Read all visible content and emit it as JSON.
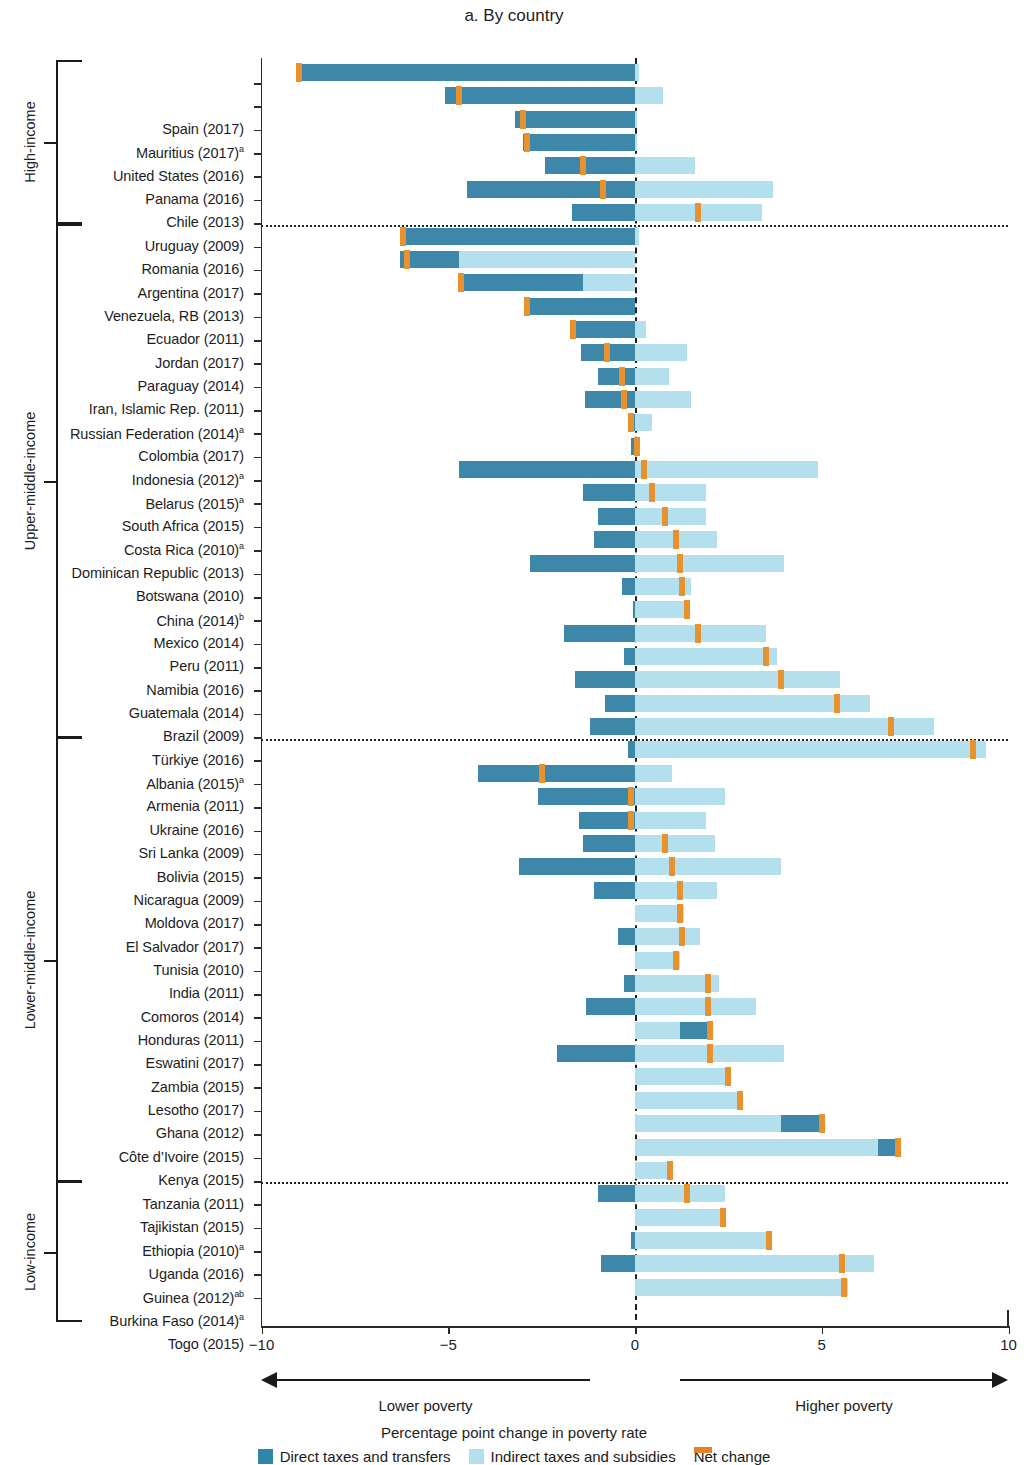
{
  "title": "a. By country",
  "axis": {
    "x_title": "Percentage point change in poverty rate",
    "ticks": [
      "−10",
      "−5",
      "0",
      "5",
      "10"
    ],
    "tick_values": [
      -10,
      -5,
      0,
      5,
      10
    ],
    "left_caption": "Lower poverty",
    "right_caption": "Higher poverty"
  },
  "legend": {
    "direct": "Direct taxes and transfers",
    "indirect": "Indirect taxes and subsidies",
    "net": "Net change"
  },
  "colors": {
    "direct": "#3d88a8",
    "indirect": "#b3e0ec",
    "net": "#e8922f"
  },
  "groups": [
    {
      "name": "High-income",
      "count": 7
    },
    {
      "name": "Upper-middle-income",
      "count": 22
    },
    {
      "name": "Lower-middle-income",
      "count": 19
    },
    {
      "name": "Low-income",
      "count": 6
    }
  ],
  "chart_data": {
    "type": "bar",
    "title": "a. By country",
    "xlabel": "Percentage point change in poverty rate",
    "ylabel": "",
    "xlim": [
      -10,
      10
    ],
    "grid": false,
    "legend_position": "bottom",
    "series": [
      {
        "name": "Direct taxes and transfers",
        "color": "#3d88a8"
      },
      {
        "name": "Indirect taxes and subsidies",
        "color": "#b3e0ec"
      },
      {
        "name": "Net change",
        "color": "#e8922f"
      }
    ],
    "note": "Each row is a floating stacked bar: the direct segment and the indirect segment are laid end to end; the orange tick marks the net change (sum).",
    "rows": [
      {
        "label": "Spain (2017)",
        "group": "High-income",
        "direct": -9.0,
        "indirect": 0.0,
        "net": -9.0,
        "direct_start": -9.05,
        "direct_end": 0.0,
        "indirect_start": 0.0,
        "indirect_end": 0.1
      },
      {
        "label": "Mauritius (2017)",
        "sup": "a",
        "group": "High-income",
        "direct": -5.1,
        "indirect": 0.75,
        "net": -4.7,
        "direct_start": -5.1,
        "direct_end": 0.0,
        "indirect_start": 0.0,
        "indirect_end": 0.75
      },
      {
        "label": "United States (2016)",
        "group": "High-income",
        "direct": -3.2,
        "indirect": 0.05,
        "net": -3.0,
        "direct_start": -3.2,
        "direct_end": 0.0,
        "indirect_start": 0.0,
        "indirect_end": 0.05
      },
      {
        "label": "Panama (2016)",
        "group": "High-income",
        "direct": -3.0,
        "indirect": 0.05,
        "net": -2.9,
        "direct_start": -3.0,
        "direct_end": 0.0,
        "indirect_start": 0.0,
        "indirect_end": 0.05
      },
      {
        "label": "Chile (2013)",
        "group": "High-income",
        "direct": -2.4,
        "indirect": 1.6,
        "net": -1.4,
        "direct_start": -2.4,
        "direct_end": 0.0,
        "indirect_start": 0.0,
        "indirect_end": 1.6
      },
      {
        "label": "Uruguay (2009)",
        "group": "High-income",
        "direct": -4.5,
        "indirect": 3.7,
        "net": -0.85,
        "direct_start": -4.5,
        "direct_end": 0.0,
        "indirect_start": 0.0,
        "indirect_end": 3.7
      },
      {
        "label": "Romania (2016)",
        "group": "High-income",
        "direct": -1.7,
        "indirect": 3.4,
        "net": 1.7,
        "direct_start": -1.7,
        "direct_end": 0.0,
        "indirect_start": 0.0,
        "indirect_end": 3.4
      },
      {
        "label": "Argentina (2017)",
        "group": "Upper-middle-income",
        "direct": -6.3,
        "indirect": 0.1,
        "net": -6.2,
        "direct_start": -6.3,
        "direct_end": 0.0,
        "indirect_start": 0.0,
        "indirect_end": 0.1
      },
      {
        "label": "Venezuela, RB (2013)",
        "group": "Upper-middle-income",
        "direct": -1.6,
        "indirect": 4.7,
        "net": -6.1,
        "direct_start": -6.3,
        "direct_end": -4.7,
        "indirect_start": -4.7,
        "indirect_end": 0.0
      },
      {
        "label": "Ecuador (2011)",
        "group": "Upper-middle-income",
        "direct": -3.3,
        "indirect": 1.5,
        "net": -4.65,
        "direct_start": -4.65,
        "direct_end": -1.4,
        "indirect_start": -1.4,
        "indirect_end": 0.0
      },
      {
        "label": "Jordan (2017)",
        "group": "Upper-middle-income",
        "direct": -2.9,
        "indirect": 0.0,
        "net": -2.9,
        "direct_start": -2.9,
        "direct_end": 0.0,
        "indirect_start": 0.0,
        "indirect_end": 0.0
      },
      {
        "label": "Paraguay (2014)",
        "group": "Upper-middle-income",
        "direct": -1.65,
        "indirect": 0.3,
        "net": -1.65,
        "direct_start": -1.65,
        "direct_end": 0.0,
        "indirect_start": 0.0,
        "indirect_end": 0.3
      },
      {
        "label": "Iran, Islamic Rep. (2011)",
        "group": "Upper-middle-income",
        "direct": -1.45,
        "indirect": 1.4,
        "net": -0.75,
        "direct_start": -1.45,
        "direct_end": 0.0,
        "indirect_start": 0.0,
        "indirect_end": 1.4
      },
      {
        "label": "Russian Federation (2014)",
        "sup": "a",
        "group": "Upper-middle-income",
        "direct": -1.0,
        "indirect": 0.9,
        "net": -0.35,
        "direct_start": -1.0,
        "direct_end": 0.0,
        "indirect_start": 0.0,
        "indirect_end": 0.9
      },
      {
        "label": "Colombia (2017)",
        "group": "Upper-middle-income",
        "direct": -1.35,
        "indirect": 1.5,
        "net": -0.3,
        "direct_start": -1.35,
        "direct_end": 0.0,
        "indirect_start": 0.0,
        "indirect_end": 1.5
      },
      {
        "label": "Indonesia (2012)",
        "sup": "a",
        "group": "Upper-middle-income",
        "direct": -0.2,
        "indirect": 0.35,
        "net": -0.1,
        "direct_start": -0.2,
        "direct_end": 0.0,
        "indirect_start": 0.0,
        "indirect_end": 0.45
      },
      {
        "label": "Belarus (2015)",
        "sup": "a",
        "group": "Upper-middle-income",
        "direct": -0.1,
        "indirect": 0.15,
        "net": 0.05,
        "direct_start": -0.1,
        "direct_end": 0.0,
        "indirect_start": 0.0,
        "indirect_end": 0.1
      },
      {
        "label": "South Africa (2015)",
        "group": "Upper-middle-income",
        "direct": -4.7,
        "indirect": 4.9,
        "net": 0.25,
        "direct_start": -4.7,
        "direct_end": 0.0,
        "indirect_start": 0.0,
        "indirect_end": 4.9
      },
      {
        "label": "Costa Rica (2010)",
        "sup": "a",
        "group": "Upper-middle-income",
        "direct": -1.4,
        "indirect": 1.9,
        "net": 0.45,
        "direct_start": -1.4,
        "direct_end": 0.0,
        "indirect_start": 0.0,
        "indirect_end": 1.9
      },
      {
        "label": "Dominican Republic (2013)",
        "group": "Upper-middle-income",
        "direct": -1.0,
        "indirect": 1.9,
        "net": 0.8,
        "direct_start": -1.0,
        "direct_end": 0.0,
        "indirect_start": 0.0,
        "indirect_end": 1.9
      },
      {
        "label": "Botswana (2010)",
        "group": "Upper-middle-income",
        "direct": -1.1,
        "indirect": 2.2,
        "net": 1.1,
        "direct_start": -1.1,
        "direct_end": 0.0,
        "indirect_start": 0.0,
        "indirect_end": 2.2
      },
      {
        "label": "China (2014)",
        "sup": "b",
        "group": "Upper-middle-income",
        "direct": -2.8,
        "indirect": 4.0,
        "net": 1.2,
        "direct_start": -2.8,
        "direct_end": 0.0,
        "indirect_start": 0.0,
        "indirect_end": 4.0
      },
      {
        "label": "Mexico (2014)",
        "group": "Upper-middle-income",
        "direct": -0.35,
        "indirect": 1.5,
        "net": 1.25,
        "direct_start": -0.35,
        "direct_end": 0.0,
        "indirect_start": 0.0,
        "indirect_end": 1.5
      },
      {
        "label": "Peru (2011)",
        "group": "Upper-middle-income",
        "direct": -0.05,
        "indirect": 1.45,
        "net": 1.4,
        "direct_start": -0.05,
        "direct_end": 0.0,
        "indirect_start": 0.0,
        "indirect_end": 1.45
      },
      {
        "label": "Namibia (2016)",
        "group": "Upper-middle-income",
        "direct": -1.9,
        "indirect": 3.5,
        "net": 1.7,
        "direct_start": -1.9,
        "direct_end": 0.0,
        "indirect_start": 0.0,
        "indirect_end": 3.5
      },
      {
        "label": "Guatemala (2014)",
        "group": "Upper-middle-income",
        "direct": -0.3,
        "indirect": 3.8,
        "net": 3.5,
        "direct_start": -0.3,
        "direct_end": 0.0,
        "indirect_start": 0.0,
        "indirect_end": 3.8
      },
      {
        "label": "Brazil (2009)",
        "group": "Upper-middle-income",
        "direct": -1.6,
        "indirect": 5.5,
        "net": 3.9,
        "direct_start": -1.6,
        "direct_end": 0.0,
        "indirect_start": 0.0,
        "indirect_end": 5.5
      },
      {
        "label": "Türkiye (2016)",
        "group": "Upper-middle-income",
        "direct": -0.8,
        "indirect": 6.3,
        "net": 5.4,
        "direct_start": -0.8,
        "direct_end": 0.0,
        "indirect_start": 0.0,
        "indirect_end": 6.3
      },
      {
        "label": "Albania (2015)",
        "sup": "a",
        "group": "Upper-middle-income",
        "direct": -1.2,
        "indirect": 8.0,
        "net": 6.85,
        "direct_start": -1.2,
        "direct_end": 0.0,
        "indirect_start": 0.0,
        "indirect_end": 8.0
      },
      {
        "label": "Armenia (2011)",
        "group": "Upper-middle-income",
        "direct": -0.2,
        "indirect": 9.4,
        "net": 9.05,
        "direct_start": -0.2,
        "direct_end": 0.0,
        "indirect_start": 0.0,
        "indirect_end": 9.4
      },
      {
        "label": "Ukraine (2016)",
        "group": "Lower-middle-income",
        "direct": -4.2,
        "indirect": 1.0,
        "net": -2.5,
        "direct_start": -4.2,
        "direct_end": 0.0,
        "indirect_start": 0.0,
        "indirect_end": 1.0
      },
      {
        "label": "Sri Lanka (2009)",
        "group": "Lower-middle-income",
        "direct": -2.6,
        "indirect": 2.4,
        "net": -0.1,
        "direct_start": -2.6,
        "direct_end": 0.0,
        "indirect_start": 0.0,
        "indirect_end": 2.4
      },
      {
        "label": "Bolivia (2015)",
        "group": "Lower-middle-income",
        "direct": -1.5,
        "indirect": 1.9,
        "net": -0.1,
        "direct_start": -1.5,
        "direct_end": 0.0,
        "indirect_start": 0.0,
        "indirect_end": 1.9
      },
      {
        "label": "Nicaragua (2009)",
        "group": "Lower-middle-income",
        "direct": -1.4,
        "indirect": 2.15,
        "net": 0.8,
        "direct_start": -1.4,
        "direct_end": 0.0,
        "indirect_start": 0.0,
        "indirect_end": 2.15
      },
      {
        "label": "Moldova (2017)",
        "group": "Lower-middle-income",
        "direct": -3.1,
        "indirect": 3.9,
        "net": 1.0,
        "direct_start": -3.1,
        "direct_end": 0.0,
        "indirect_start": 0.0,
        "indirect_end": 3.9
      },
      {
        "label": "El Salvador (2017)",
        "group": "Lower-middle-income",
        "direct": -1.1,
        "indirect": 2.2,
        "net": 1.2,
        "direct_start": -1.1,
        "direct_end": 0.0,
        "indirect_start": 0.0,
        "indirect_end": 2.2
      },
      {
        "label": "Tunisia (2010)",
        "group": "Lower-middle-income",
        "direct": 0.0,
        "indirect": 1.3,
        "net": 1.2,
        "direct_start": 0.0,
        "direct_end": 0.0,
        "indirect_start": 0.0,
        "indirect_end": 1.3
      },
      {
        "label": "India (2011)",
        "group": "Lower-middle-income",
        "direct": -0.45,
        "indirect": 1.75,
        "net": 1.25,
        "direct_start": -0.45,
        "direct_end": 0.0,
        "indirect_start": 0.0,
        "indirect_end": 1.75
      },
      {
        "label": "Comoros (2014)",
        "group": "Lower-middle-income",
        "direct": 0.0,
        "indirect": 1.2,
        "net": 1.1,
        "direct_start": 0.0,
        "direct_end": 0.0,
        "indirect_start": 0.0,
        "indirect_end": 1.2
      },
      {
        "label": "Honduras (2011)",
        "group": "Lower-middle-income",
        "direct": -0.3,
        "indirect": 2.25,
        "net": 1.95,
        "direct_start": -0.3,
        "direct_end": 0.0,
        "indirect_start": 0.0,
        "indirect_end": 2.25
      },
      {
        "label": "Eswatini (2017)",
        "group": "Lower-middle-income",
        "direct": -1.3,
        "indirect": 3.25,
        "net": 1.95,
        "direct_start": -1.3,
        "direct_end": 0.0,
        "indirect_start": 0.0,
        "indirect_end": 3.25
      },
      {
        "label": "Zambia (2015)",
        "group": "Lower-middle-income",
        "direct": 0.8,
        "indirect": 1.2,
        "net": 2.0,
        "direct_start": 1.2,
        "direct_end": 2.0,
        "indirect_start": 0.0,
        "indirect_end": 1.2
      },
      {
        "label": "Lesotho (2017)",
        "group": "Lower-middle-income",
        "direct": -2.1,
        "indirect": 4.0,
        "net": 2.0,
        "direct_start": -2.1,
        "direct_end": 0.0,
        "indirect_start": 0.0,
        "indirect_end": 4.0
      },
      {
        "label": "Ghana (2012)",
        "group": "Lower-middle-income",
        "direct": 0.0,
        "indirect": 2.5,
        "net": 2.5,
        "direct_start": 0.0,
        "direct_end": 0.0,
        "indirect_start": 0.0,
        "indirect_end": 2.5
      },
      {
        "label": "Côte d’Ivoire (2015)",
        "group": "Lower-middle-income",
        "direct": 0.0,
        "indirect": 2.85,
        "net": 2.8,
        "direct_start": 0.0,
        "direct_end": 0.0,
        "indirect_start": 0.0,
        "indirect_end": 2.85
      },
      {
        "label": "Kenya (2015)",
        "group": "Lower-middle-income",
        "direct": 1.1,
        "indirect": 3.9,
        "net": 5.0,
        "direct_start": 3.9,
        "direct_end": 5.05,
        "indirect_start": 0.0,
        "indirect_end": 3.9
      },
      {
        "label": "Tanzania (2011)",
        "group": "Lower-middle-income",
        "direct": 0.6,
        "indirect": 6.5,
        "net": 7.05,
        "direct_start": 6.5,
        "direct_end": 7.1,
        "indirect_start": 0.0,
        "indirect_end": 6.5
      },
      {
        "label": "Tajikistan (2015)",
        "group": "Low-income",
        "direct": 0.0,
        "indirect": 1.0,
        "net": 0.95,
        "direct_start": 0.0,
        "direct_end": 0.0,
        "indirect_start": 0.0,
        "indirect_end": 1.0
      },
      {
        "label": "Ethiopia (2010)",
        "sup": "a",
        "group": "Low-income",
        "direct": -1.0,
        "indirect": 2.4,
        "net": 1.4,
        "direct_start": -1.0,
        "direct_end": 0.0,
        "indirect_start": 0.0,
        "indirect_end": 2.4
      },
      {
        "label": "Uganda (2016)",
        "group": "Low-income",
        "direct": 0.0,
        "indirect": 2.4,
        "net": 2.35,
        "direct_start": 0.0,
        "direct_end": 0.0,
        "indirect_start": 0.0,
        "indirect_end": 2.4
      },
      {
        "label": "Guinea (2012)",
        "sup": "ab",
        "group": "Low-income",
        "direct": -0.1,
        "indirect": 3.65,
        "net": 3.6,
        "direct_start": -0.1,
        "direct_end": 0.0,
        "indirect_start": 0.0,
        "indirect_end": 3.65
      },
      {
        "label": "Burkina Faso (2014)",
        "sup": "a",
        "group": "Low-income",
        "direct": -0.9,
        "indirect": 6.4,
        "net": 5.55,
        "direct_start": -0.9,
        "direct_end": 0.0,
        "indirect_start": 0.0,
        "indirect_end": 6.4
      },
      {
        "label": "Togo (2015)",
        "group": "Low-income",
        "direct": 0.0,
        "indirect": 5.7,
        "net": 5.6,
        "direct_start": 0.0,
        "direct_end": 0.0,
        "indirect_start": 0.0,
        "indirect_end": 5.7
      }
    ]
  }
}
